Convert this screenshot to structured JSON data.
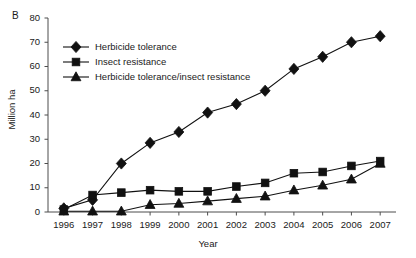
{
  "figure": {
    "panel_letter": "B",
    "background_color": "#ffffff",
    "line_color": "#111111"
  },
  "chart_data": {
    "type": "line",
    "title": "",
    "subtitle": "",
    "xlabel": "Year",
    "ylabel": "Million ha",
    "categories": [
      "1996",
      "1997",
      "1998",
      "1999",
      "2000",
      "2001",
      "2002",
      "2003",
      "2004",
      "2005",
      "2006",
      "2007"
    ],
    "x": [
      1996,
      1997,
      1998,
      1999,
      2000,
      2001,
      2002,
      2003,
      2004,
      2005,
      2006,
      2007
    ],
    "xlim": [
      1995.5,
      2007.5
    ],
    "ylim": [
      0,
      80
    ],
    "yticks": [
      0,
      10,
      20,
      30,
      40,
      50,
      60,
      70,
      80
    ],
    "ytick_labels": [
      "0",
      "10",
      "20",
      "30",
      "40",
      "50",
      "60",
      "70",
      "80"
    ],
    "grid": false,
    "legend_position": "upper-left-inside",
    "series": [
      {
        "name": "Herbicide tolerance",
        "marker": "diamond",
        "values": [
          1.5,
          5.0,
          20.0,
          28.5,
          33.0,
          41.0,
          44.5,
          50.0,
          59.0,
          64.0,
          70.0,
          72.5
        ]
      },
      {
        "name": "Insect resistance",
        "marker": "square",
        "values": [
          1.0,
          7.0,
          8.0,
          9.0,
          8.5,
          8.5,
          10.5,
          12.0,
          16.0,
          16.5,
          19.0,
          21.0
        ]
      },
      {
        "name": "Herbicide tolerance/insect resistance",
        "marker": "triangle",
        "values": [
          0.3,
          0.3,
          0.3,
          3.0,
          3.5,
          4.5,
          5.5,
          6.5,
          9.0,
          11.0,
          13.5,
          20.0
        ]
      }
    ]
  },
  "legend": {
    "entries": [
      {
        "label": "Herbicide tolerance",
        "marker": "diamond"
      },
      {
        "label": "Insect resistance",
        "marker": "square"
      },
      {
        "label": "Herbicide tolerance/insect resistance",
        "marker": "triangle"
      }
    ]
  }
}
